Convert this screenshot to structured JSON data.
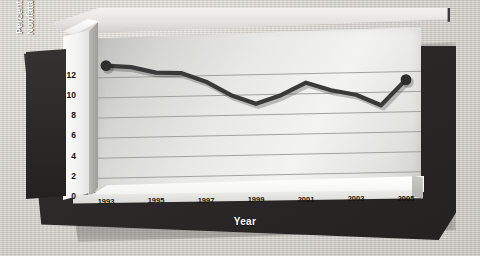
{
  "chart_data": {
    "type": "line",
    "title": "",
    "xlabel": "Year",
    "ylabel": "Percent of Violent Nonfatal Incidents",
    "x": [
      1993,
      1994,
      1995,
      1996,
      1997,
      1998,
      1999,
      2000,
      2001,
      2002,
      2003,
      2004,
      2005
    ],
    "values": [
      13.2,
      13.0,
      12.4,
      12.3,
      11.4,
      10.0,
      9.1,
      9.9,
      11.1,
      10.3,
      9.8,
      8.7,
      11.2
    ],
    "series": [
      {
        "name": "Percent of violent nonfatal incidents",
        "values": [
          13.2,
          13.0,
          12.4,
          12.3,
          11.4,
          10.0,
          9.1,
          9.9,
          11.1,
          10.3,
          9.8,
          8.7,
          11.2
        ]
      }
    ],
    "xtick_labels": [
      "1993",
      "1995",
      "1997",
      "1999",
      "2001",
      "2003",
      "2005"
    ],
    "xtick_values": [
      1993,
      1995,
      1997,
      1999,
      2001,
      2003,
      2005
    ],
    "ytick_labels": [
      "0",
      "2",
      "4",
      "6",
      "8",
      "10",
      "12"
    ],
    "ytick_values": [
      0,
      2,
      4,
      6,
      8,
      10,
      12
    ],
    "xlim": [
      1993,
      2005
    ],
    "ylim": [
      0,
      13.6
    ],
    "grid": true,
    "gridlines": "horizontal",
    "legend": "none",
    "markers": "endpoints only",
    "line_color": "#3a3a3a",
    "marker_color": "#2e2e2e",
    "style": "3d-perspective-panel"
  },
  "axes": {
    "y_title_line1": "Percent of Violent",
    "y_title_line2": "Nonfatal Incidents",
    "y_title": "Percent of Violent\nNonfatal Incidents",
    "x_title": "Year"
  },
  "ticks": {
    "y": [
      {
        "label": "12",
        "value": 12
      },
      {
        "label": "10",
        "value": 10
      },
      {
        "label": "8",
        "value": 8
      },
      {
        "label": "6",
        "value": 6
      },
      {
        "label": "4",
        "value": 4
      },
      {
        "label": "2",
        "value": 2
      },
      {
        "label": "0",
        "value": 0
      }
    ],
    "x": [
      {
        "label": "1993",
        "value": 1993
      },
      {
        "label": "1995",
        "value": 1995
      },
      {
        "label": "1997",
        "value": 1997
      },
      {
        "label": "1999",
        "value": 1999
      },
      {
        "label": "2001",
        "value": 2001
      },
      {
        "label": "2003",
        "value": 2003
      },
      {
        "label": "2005",
        "value": 2005
      }
    ]
  },
  "colors": {
    "background": "#d5d2cb",
    "frame_dark": "#2b2a28",
    "panel_light": "#f0f0ee",
    "line": "#3a3a3a",
    "tick_text": "#141414",
    "title_text": "#ffffff"
  }
}
